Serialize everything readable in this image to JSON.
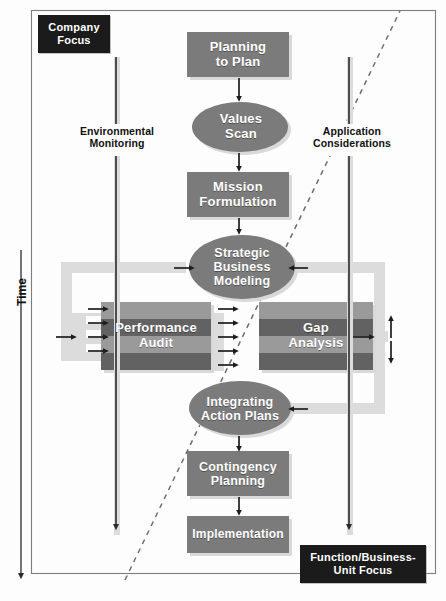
{
  "diagram": {
    "type": "flowchart",
    "axis": {
      "label": "Time",
      "direction": "downward"
    },
    "corner_labels": {
      "top_left": "Company\nFocus",
      "top_left_line1": "Company",
      "top_left_line2": "Focus",
      "bottom_right_line1": "Function/Business-",
      "bottom_right_line2": "Unit Focus"
    },
    "side_channels": [
      {
        "id": "environmental-monitoring",
        "line1": "Environmental",
        "line2": "Monitoring",
        "side": "left"
      },
      {
        "id": "application-considerations",
        "line1": "Application",
        "line2": "Considerations",
        "side": "right"
      }
    ],
    "nodes": [
      {
        "id": "planning-to-plan",
        "shape": "rect",
        "line1": "Planning",
        "line2": "to Plan",
        "line3": ""
      },
      {
        "id": "values-scan",
        "shape": "ellipse",
        "line1": "Values",
        "line2": "Scan",
        "line3": ""
      },
      {
        "id": "mission-formulation",
        "shape": "rect",
        "line1": "Mission",
        "line2": "Formulation",
        "line3": ""
      },
      {
        "id": "strategic-business-modeling",
        "shape": "ellipse",
        "line1": "Strategic",
        "line2": "Business",
        "line3": "Modeling"
      },
      {
        "id": "performance-audit",
        "shape": "striped-rect",
        "line1": "Performance",
        "line2": "Audit",
        "line3": ""
      },
      {
        "id": "gap-analysis",
        "shape": "striped-rect",
        "line1": "Gap",
        "line2": "Analysis",
        "line3": ""
      },
      {
        "id": "integrating-action-plans",
        "shape": "ellipse",
        "line1": "Integrating",
        "line2": "Action Plans",
        "line3": ""
      },
      {
        "id": "contingency-planning",
        "shape": "rect",
        "line1": "Contingency",
        "line2": "Planning",
        "line3": ""
      },
      {
        "id": "implementation",
        "shape": "rect",
        "line1": "Implementation",
        "line2": "",
        "line3": ""
      }
    ],
    "colors": {
      "node_fill": "#7b7b7b",
      "node_shadow": "#d9d9d9",
      "stripe_light": "#9a9a9a",
      "stripe_dark": "#626262",
      "loop_band": "#dcdcdc",
      "black_label": "#1b1b1b",
      "line": "#2a2a2a",
      "background": "#fdfdfd",
      "divider_dashed": "#6d6d6d"
    },
    "annotations": {
      "diagonal_divider": "dashed line separating company focus from function/business-unit focus"
    }
  }
}
